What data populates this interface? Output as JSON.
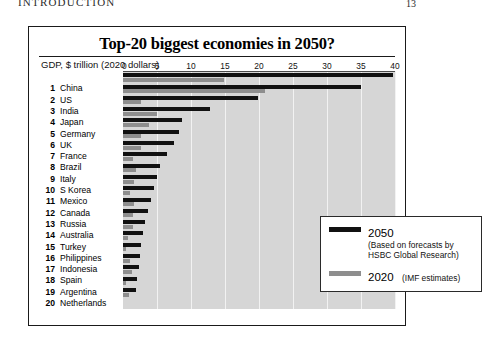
{
  "page": {
    "running_head": "INTRODUCTION",
    "folio": "13"
  },
  "figure": {
    "title": "Top-20 biggest economies in 2050?",
    "axis_caption": "GDP, $ trillion (2020 dollars)"
  },
  "legend": {
    "series_2050_label": "2050",
    "series_2050_note": "(Based on forecasts by HSBC Global Research)",
    "series_2020_label": "2020",
    "series_2020_note": "(IMF estimates)",
    "color_2050": "#111111",
    "color_2020": "#8e8e8e"
  },
  "chart_data": {
    "type": "bar",
    "orientation": "horizontal",
    "title": "Top-20 biggest economies in 2050?",
    "xlabel": "GDP, $ trillion (2020 dollars)",
    "ylabel": "",
    "xlim": [
      0,
      40
    ],
    "xticks": [
      0,
      5,
      10,
      15,
      20,
      25,
      30,
      35,
      40
    ],
    "grid": true,
    "legend_position": "bottom-right",
    "categories": [
      "China",
      "US",
      "India",
      "Japan",
      "Germany",
      "UK",
      "France",
      "Brazil",
      "Italy",
      "S Korea",
      "Mexico",
      "Canada",
      "Russia",
      "Australia",
      "Turkey",
      "Philippines",
      "Indonesia",
      "Spain",
      "Argentina",
      "Netherlands"
    ],
    "ranks": [
      1,
      2,
      3,
      4,
      5,
      6,
      7,
      8,
      9,
      10,
      11,
      12,
      13,
      14,
      15,
      16,
      17,
      18,
      19,
      20
    ],
    "series": [
      {
        "name": "2050",
        "color": "#111111",
        "values": [
          39.7,
          35.0,
          19.9,
          12.8,
          8.7,
          8.2,
          7.5,
          6.4,
          5.5,
          5.0,
          4.5,
          4.1,
          3.7,
          3.3,
          3.0,
          2.7,
          2.5,
          2.3,
          2.1,
          1.9
        ]
      },
      {
        "name": "2020",
        "color": "#8e8e8e",
        "values": [
          14.9,
          20.9,
          2.6,
          5.0,
          3.8,
          2.7,
          2.6,
          1.4,
          1.9,
          1.6,
          1.1,
          1.6,
          1.5,
          1.4,
          0.7,
          0.4,
          1.1,
          1.3,
          0.4,
          0.9
        ]
      }
    ]
  }
}
